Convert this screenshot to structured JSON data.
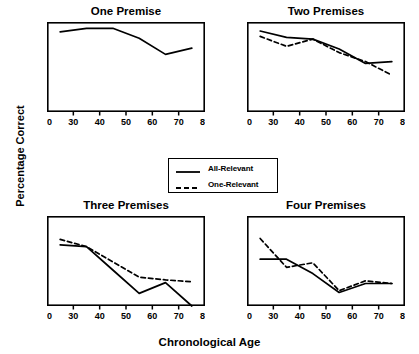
{
  "figure": {
    "xlabel": "Chronological Age",
    "ylabel": "Percentage Correct"
  },
  "legend": {
    "items": [
      {
        "label": "All-Relevant",
        "style": "solid"
      },
      {
        "label": "One-Relevant",
        "style": "dashed"
      }
    ]
  },
  "chart_data": [
    {
      "type": "line",
      "title": "One Premise",
      "xlabel": "Chronological Age",
      "ylabel": "Percentage Correct",
      "xlim": [
        20,
        80
      ],
      "ylim": [
        50,
        100
      ],
      "xticks": [
        20,
        30,
        40,
        50,
        60,
        70,
        80
      ],
      "yticks": [
        50,
        60,
        70,
        80,
        90,
        100
      ],
      "grid": false,
      "legend_position": "figure-center",
      "x": [
        25,
        35,
        45,
        55,
        65,
        75
      ],
      "series": [
        {
          "name": "All-Relevant",
          "style": "solid",
          "values": [
            94.5,
            96.5,
            96.5,
            91.0,
            82.0,
            85.5
          ]
        }
      ]
    },
    {
      "type": "line",
      "title": "Two Premises",
      "xlabel": "Chronological Age",
      "ylabel": "Percentage Correct",
      "xlim": [
        20,
        80
      ],
      "ylim": [
        50,
        100
      ],
      "xticks": [
        20,
        30,
        40,
        50,
        60,
        70,
        80
      ],
      "yticks": [
        50,
        60,
        70,
        80,
        90,
        100
      ],
      "grid": false,
      "x": [
        25,
        35,
        45,
        55,
        65,
        75
      ],
      "series": [
        {
          "name": "All-Relevant",
          "style": "solid",
          "values": [
            95.0,
            91.5,
            90.5,
            85.0,
            77.0,
            78.0
          ]
        },
        {
          "name": "One-Relevant",
          "style": "dashed",
          "values": [
            92.0,
            86.5,
            90.5,
            83.0,
            78.0,
            70.5
          ]
        }
      ]
    },
    {
      "type": "line",
      "title": "Three Premises",
      "xlabel": "Chronological Age",
      "ylabel": "Percentage Correct",
      "xlim": [
        20,
        80
      ],
      "ylim": [
        50,
        100
      ],
      "xticks": [
        20,
        30,
        40,
        50,
        60,
        70,
        80
      ],
      "yticks": [
        50,
        60,
        70,
        80,
        90,
        100
      ],
      "grid": false,
      "x": [
        25,
        35,
        45,
        55,
        65,
        75
      ],
      "series": [
        {
          "name": "All-Relevant",
          "style": "solid",
          "values": [
            84.0,
            83.0,
            70.0,
            57.0,
            63.0,
            50.0
          ]
        },
        {
          "name": "One-Relevant",
          "style": "dashed",
          "values": [
            87.0,
            83.0,
            74.5,
            66.0,
            64.5,
            63.5
          ]
        }
      ]
    },
    {
      "type": "line",
      "title": "Four Premises",
      "xlabel": "Chronological Age",
      "ylabel": "Percentage Correct",
      "xlim": [
        20,
        80
      ],
      "ylim": [
        50,
        100
      ],
      "xticks": [
        20,
        30,
        40,
        50,
        60,
        70,
        80
      ],
      "yticks": [
        50,
        60,
        70,
        80,
        90,
        100
      ],
      "grid": false,
      "x": [
        25,
        35,
        45,
        55,
        65,
        75
      ],
      "series": [
        {
          "name": "All-Relevant",
          "style": "solid",
          "values": [
            76.0,
            76.0,
            68.0,
            57.5,
            62.5,
            62.5
          ]
        },
        {
          "name": "One-Relevant",
          "style": "dashed",
          "values": [
            87.5,
            71.5,
            74.0,
            58.5,
            64.0,
            62.5
          ]
        }
      ]
    }
  ]
}
